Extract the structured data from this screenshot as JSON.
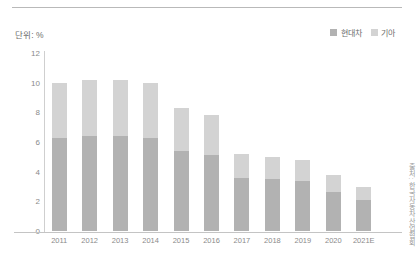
{
  "unit_label": "단위: %",
  "source_note": "출처: 한국자동차산업협회",
  "legend": {
    "items": [
      {
        "label": "현대차",
        "color": "#b2b2b2"
      },
      {
        "label": "기아",
        "color": "#d3d3d3"
      }
    ]
  },
  "chart_data": {
    "type": "bar",
    "stacked": true,
    "title": "",
    "subtitle": "",
    "xlabel": "",
    "ylabel": "단위: %",
    "ylim": [
      0,
      12
    ],
    "ytick_values": [
      0,
      2,
      4,
      6,
      8,
      10,
      12
    ],
    "ytick_labels": [
      "0",
      "2",
      "4",
      "6",
      "8",
      "10",
      "12"
    ],
    "grid": false,
    "legend_position": "top-right",
    "categories": [
      "2011",
      "2012",
      "2013",
      "2014",
      "2015",
      "2016",
      "2017",
      "2018",
      "2019",
      "2020",
      "2021E"
    ],
    "series": [
      {
        "name": "현대차",
        "color": "#b2b2b2",
        "values": [
          6.3,
          6.4,
          6.4,
          6.3,
          5.4,
          5.1,
          3.6,
          3.5,
          3.4,
          2.6,
          2.1
        ]
      },
      {
        "name": "기아",
        "color": "#d3d3d3",
        "values": [
          3.7,
          3.8,
          3.8,
          3.7,
          2.9,
          2.7,
          1.6,
          1.5,
          1.4,
          1.2,
          0.9
        ]
      }
    ],
    "totals": [
      10.0,
      10.2,
      10.2,
      10.0,
      8.3,
      7.8,
      5.2,
      5.0,
      4.8,
      3.8,
      3.0
    ]
  },
  "colors": {
    "bar_hyundai": "#b2b2b2",
    "bar_kia": "#d3d3d3",
    "axis": "#c4c4c4",
    "text": "#8a8a8a",
    "rule": "#b9b9b9"
  }
}
